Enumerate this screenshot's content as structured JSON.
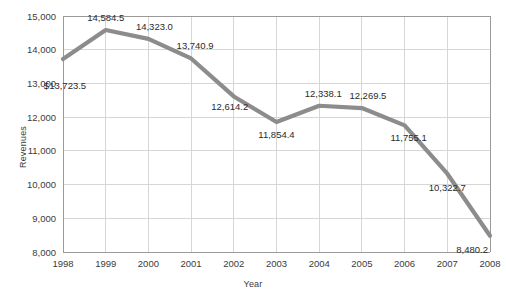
{
  "chart_data": {
    "type": "line",
    "title": "",
    "xlabel": "Year",
    "ylabel": "Revenues",
    "categories": [
      "1998",
      "1999",
      "2000",
      "2001",
      "2002",
      "2003",
      "2004",
      "2005",
      "2006",
      "2007",
      "2008"
    ],
    "values": [
      13723.5,
      14584.5,
      14323.0,
      13740.9,
      12614.2,
      11854.4,
      12338.1,
      12269.5,
      11755.1,
      10322.7,
      8480.2
    ],
    "point_labels": [
      "$13,723.5",
      "14,584.5",
      "14,323.0",
      "13,740.9",
      "12,614.2",
      "11,854.4",
      "12,338.1",
      "12,269.5",
      "11,755.1",
      "10,322.7",
      "8,480.2"
    ],
    "ylim": [
      8000,
      15000
    ],
    "ytick_values": [
      8000,
      9000,
      10000,
      11000,
      12000,
      13000,
      14000,
      15000
    ],
    "ytick_labels": [
      "8,000",
      "9,000",
      "10,000",
      "11,000",
      "12,000",
      "13,000",
      "14,000",
      "15,000"
    ],
    "grid": "horizontal-and-vertical",
    "legend": "none",
    "series_color": "#8c8c8c",
    "grid_color": "#d6d6d6",
    "axis_color": "#9a9a9a",
    "text_color": "#3b3b3b"
  }
}
